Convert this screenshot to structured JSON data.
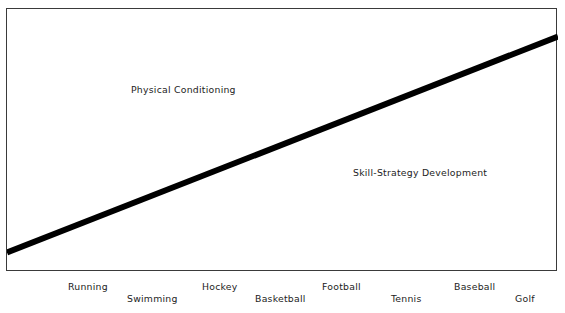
{
  "figure": {
    "background_color": "#ffffff",
    "frame_color": "#3a3a3a",
    "line_color": "#000000"
  },
  "region_labels": {
    "above_line": "Physical Conditioning",
    "below_line": "Skill-Strategy Development"
  },
  "axis": {
    "sports": [
      {
        "label": "Running",
        "row": "upper",
        "x": 68
      },
      {
        "label": "Swimming",
        "row": "lower",
        "x": 127
      },
      {
        "label": "Hockey",
        "row": "upper",
        "x": 202
      },
      {
        "label": "Basketball",
        "row": "lower",
        "x": 255
      },
      {
        "label": "Football",
        "row": "upper",
        "x": 322
      },
      {
        "label": "Tennis",
        "row": "lower",
        "x": 391
      },
      {
        "label": "Baseball",
        "row": "upper",
        "x": 454
      },
      {
        "label": "Golf",
        "row": "lower",
        "x": 515
      }
    ]
  },
  "chart_data": {
    "type": "line",
    "title": "",
    "subtitle": "",
    "xlabel": "",
    "ylabel": "",
    "grid": false,
    "legend_position": "none",
    "categories": [
      "Running",
      "Swimming",
      "Hockey",
      "Basketball",
      "Football",
      "Tennis",
      "Baseball",
      "Golf"
    ],
    "x": [
      0,
      1,
      2,
      3,
      4,
      5,
      6,
      7
    ],
    "series": [
      {
        "name": "Physical Conditioning / Skill-Strategy boundary",
        "values": [
          8,
          20,
          31,
          43,
          55,
          66,
          78,
          90
        ]
      }
    ],
    "ylim": [
      0,
      100
    ],
    "xlim": [
      0,
      7
    ],
    "annotations": [
      {
        "text": "Physical Conditioning",
        "region": "above-line",
        "x": 1.6,
        "y": 74
      },
      {
        "text": "Skill-Strategy Development",
        "region": "below-line",
        "x": 4.5,
        "y": 41
      }
    ],
    "line_width_px": 6
  }
}
